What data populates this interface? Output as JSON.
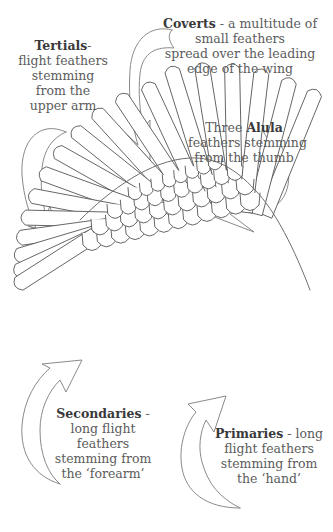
{
  "diagram": {
    "labels": {
      "tertials": {
        "term": "Tertials",
        "lines": [
          "- ",
          "flight feathers",
          "stemming",
          "from the",
          "upper arm"
        ]
      },
      "coverts": {
        "term": "Coverts",
        "lines": [
          " - a multitude of",
          "small feathers",
          "spread over the leading",
          "edge of the wing"
        ]
      },
      "alula": {
        "prefix": "Three ",
        "term": "Alula",
        "lines": [
          "feathers stemming",
          "from the thumb"
        ]
      },
      "secondaries": {
        "term": "Secondaries",
        "lines": [
          " -",
          "long flight",
          "feathers",
          "stemming from",
          "the ‘forearm’"
        ]
      },
      "primaries": {
        "term": "Primaries",
        "lines": [
          " - long",
          "flight feathers",
          "stemming from",
          "the ‘hand’"
        ]
      }
    },
    "arrows": [
      {
        "name": "tertials-arrow",
        "points_to": "tertials"
      },
      {
        "name": "coverts-arrow",
        "points_to": "coverts"
      },
      {
        "name": "alula-arrow",
        "points_to": "alula"
      },
      {
        "name": "secondaries-arrow",
        "points_to": "secondaries"
      },
      {
        "name": "primaries-arrow",
        "points_to": "primaries"
      }
    ],
    "colors": {
      "text": "#5c5c5c",
      "term_text": "#3a3a3a",
      "line_art": "#6e6e6e",
      "background": "#ffffff"
    }
  }
}
